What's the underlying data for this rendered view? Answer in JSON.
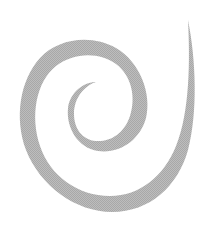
{
  "image": {
    "subject": "spiral",
    "background_color": "#ffffff",
    "stroke_color": "#b3b3b3",
    "width": 224,
    "height": 228
  }
}
